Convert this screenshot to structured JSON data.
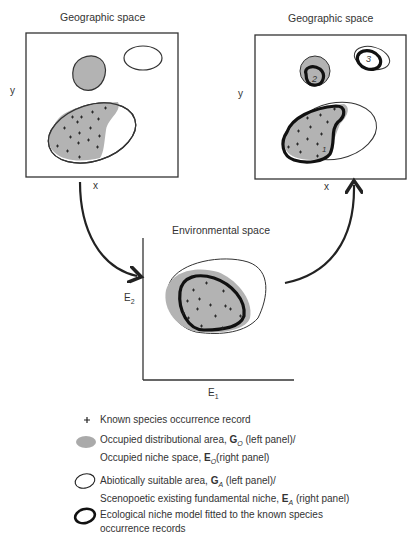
{
  "panels": {
    "left": {
      "title": "Geographic space",
      "x_label": "x",
      "y_label": "y"
    },
    "right": {
      "title": "Geographic space",
      "x_label": "x",
      "y_label": "y",
      "region_labels": [
        "1",
        "2",
        "3"
      ]
    },
    "center": {
      "title": "Environmental space",
      "x_label": "E",
      "x_sub": "1",
      "y_label": "E",
      "y_sub": "2"
    }
  },
  "legend": [
    {
      "symbol": "plus",
      "text": "Known species occurrence record"
    },
    {
      "symbol": "grey-filled-ellipse",
      "line1_prefix": "Occupied distributional area, ",
      "line1_bold": "G",
      "line1_sub": "O",
      "line1_suffix": " (left panel)/",
      "line2_prefix": "Occupied niche space, ",
      "line2_bold": "E",
      "line2_sub": "O",
      "line2_suffix": "(right panel)"
    },
    {
      "symbol": "thin-outline-ellipse",
      "line1_prefix": "Abiotically suitable area, ",
      "line1_bold": "G",
      "line1_sub": "A",
      "line1_suffix": " (left panel)/",
      "line2_prefix": "Scenopoetic existing fundamental niche, ",
      "line2_bold": "E",
      "line2_sub": "A",
      "line2_suffix": " (right panel)"
    },
    {
      "symbol": "thick-outline-ellipse",
      "line1": "Ecological niche model fitted to the known species",
      "line2": "occurrence records"
    }
  ],
  "colors": {
    "grey_fill": "#b3b3b3",
    "stroke": "#222222",
    "background": "#ffffff"
  }
}
